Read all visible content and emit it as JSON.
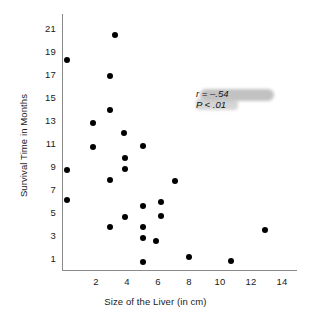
{
  "chart_data": {
    "type": "scatter",
    "title": "",
    "xlabel": "Size of the Liver (in cm)",
    "ylabel": "Survival Time in Months",
    "xlim": [
      0,
      15
    ],
    "ylim": [
      0,
      21.8
    ],
    "grid": false,
    "legend": "none",
    "xticks": [
      2,
      4,
      6,
      8,
      10,
      12,
      14
    ],
    "yticks": [
      1,
      3,
      5,
      7,
      9,
      11,
      13,
      15,
      17,
      19,
      21
    ],
    "xtick_labels": [
      "2",
      "4",
      "6",
      "8",
      "10",
      "12",
      "14"
    ],
    "ytick_labels": [
      "1",
      "3",
      "5",
      "7",
      "9",
      "11",
      "13",
      "15",
      "17",
      "19",
      "21"
    ],
    "marker": "filled-circle",
    "marker_color": "#000000",
    "points": [
      {
        "x": 3.2,
        "y": 20.4
      },
      {
        "x": 0.15,
        "y": 18.3
      },
      {
        "x": 2.9,
        "y": 16.9
      },
      {
        "x": 2.9,
        "y": 13.9
      },
      {
        "x": 1.8,
        "y": 12.8
      },
      {
        "x": 3.8,
        "y": 11.9
      },
      {
        "x": 5.0,
        "y": 10.8
      },
      {
        "x": 1.8,
        "y": 10.7
      },
      {
        "x": 3.9,
        "y": 9.7
      },
      {
        "x": 3.9,
        "y": 8.8
      },
      {
        "x": 0.1,
        "y": 8.7
      },
      {
        "x": 2.9,
        "y": 7.8
      },
      {
        "x": 7.1,
        "y": 7.7
      },
      {
        "x": 0.15,
        "y": 6.1
      },
      {
        "x": 6.2,
        "y": 5.9
      },
      {
        "x": 5.0,
        "y": 5.6
      },
      {
        "x": 6.2,
        "y": 4.7
      },
      {
        "x": 3.9,
        "y": 4.6
      },
      {
        "x": 12.9,
        "y": 3.5
      },
      {
        "x": 5.0,
        "y": 3.7
      },
      {
        "x": 2.9,
        "y": 3.7
      },
      {
        "x": 5.0,
        "y": 2.8
      },
      {
        "x": 5.9,
        "y": 2.5
      },
      {
        "x": 8.0,
        "y": 1.1
      },
      {
        "x": 10.7,
        "y": 0.8
      },
      {
        "x": 5.0,
        "y": 0.7
      }
    ],
    "annotations": {
      "correlation_label": "r",
      "correlation_text": "r = –.54",
      "pvalue_text": "P < .01",
      "highlight_color": "#b8b8b8"
    }
  },
  "axes": {
    "line_color": "#8a8a8a"
  }
}
